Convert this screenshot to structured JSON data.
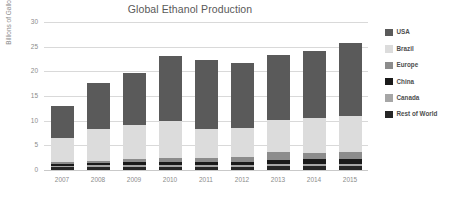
{
  "chart_data": {
    "type": "bar",
    "subtype": "stacked-bar",
    "title": "Global Ethanol Production",
    "xlabel": "",
    "ylabel": "Billions of Gallons",
    "ylim": [
      0,
      30
    ],
    "yticks": [
      0,
      5,
      10,
      15,
      20,
      25,
      30
    ],
    "grid": true,
    "legend_position": "right",
    "categories": [
      "2007",
      "2008",
      "2009",
      "2010",
      "2011",
      "2012",
      "2013",
      "2014",
      "2015"
    ],
    "stack_order_bottom_to_top": [
      "Rest of World",
      "Canada",
      "China",
      "Europe",
      "Brazil",
      "USA"
    ],
    "series": [
      {
        "name": "Rest of World",
        "color": "#262626",
        "values": [
          0.6,
          0.7,
          0.7,
          0.7,
          0.6,
          0.6,
          0.75,
          0.8,
          0.8
        ]
      },
      {
        "name": "Canada",
        "color": "#a6a6a6",
        "values": [
          0.2,
          0.25,
          0.35,
          0.4,
          0.45,
          0.45,
          0.5,
          0.5,
          0.5
        ]
      },
      {
        "name": "China",
        "color": "#1a1a1a",
        "values": [
          0.35,
          0.4,
          0.5,
          0.5,
          0.5,
          0.5,
          0.85,
          0.85,
          0.85
        ]
      },
      {
        "name": "Europe",
        "color": "#8c8c8c",
        "values": [
          0.4,
          0.5,
          0.6,
          0.9,
          0.95,
          1.0,
          1.5,
          1.4,
          1.5
        ]
      },
      {
        "name": "Brazil",
        "color": "#dcdcdc",
        "values": [
          5.0,
          6.4,
          6.9,
          7.4,
          5.9,
          6.0,
          6.5,
          7.0,
          7.2
        ]
      },
      {
        "name": "USA",
        "color": "#5a5a5a",
        "values": [
          6.5,
          9.3,
          10.7,
          13.3,
          13.9,
          13.2,
          13.3,
          13.6,
          14.8
        ]
      }
    ],
    "totals": [
      13.05,
      17.55,
      19.75,
      23.2,
      22.3,
      21.75,
      23.4,
      24.15,
      25.65
    ]
  },
  "legend": {
    "items": [
      {
        "label": "USA",
        "color": "#5a5a5a"
      },
      {
        "label": "Brazil",
        "color": "#dcdcdc"
      },
      {
        "label": "Europe",
        "color": "#8c8c8c"
      },
      {
        "label": "China",
        "color": "#1a1a1a"
      },
      {
        "label": "Canada",
        "color": "#a6a6a6"
      },
      {
        "label": "Rest of World",
        "color": "#262626"
      }
    ]
  },
  "colors": {
    "background": "#ffffff",
    "grid": "#d9d9d9",
    "tick_text": "#8c8c8c",
    "title_text": "#595959"
  }
}
